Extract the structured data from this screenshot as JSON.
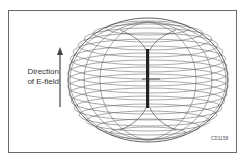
{
  "diagram": {
    "field_label_line1": "Direction",
    "field_label_line2": "of E-field",
    "figure_code": "CD1158",
    "colors": {
      "frame": "#6a6a6a",
      "mesh": "#555555",
      "antenna": "#222222",
      "arrow": "#444444"
    }
  }
}
